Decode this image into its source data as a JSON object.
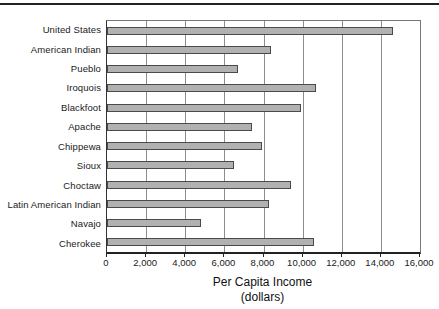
{
  "figure": {
    "top_rule_color": "#222222"
  },
  "chart_data": {
    "type": "bar",
    "orientation": "horizontal",
    "title": "",
    "xlabel": "Per Capita Income",
    "xlabel_sub": "(dollars)",
    "ylabel": "",
    "categories": [
      "United States",
      "American Indian",
      "Pueblo",
      "Iroquois",
      "Blackfoot",
      "Apache",
      "Chippewa",
      "Sioux",
      "Choctaw",
      "Latin American Indian",
      "Navajo",
      "Cherokee"
    ],
    "values": [
      14600,
      8400,
      6700,
      10700,
      9900,
      7400,
      7900,
      6500,
      9400,
      8300,
      4800,
      10600
    ],
    "xlim": [
      0,
      16000
    ],
    "xticks": [
      0,
      2000,
      4000,
      6000,
      8000,
      10000,
      12000,
      14000,
      16000
    ],
    "xtick_labels": [
      "0",
      "2,000",
      "4,000",
      "6,000",
      "8,000",
      "10,000",
      "12,000",
      "14,000",
      "16,000"
    ],
    "grid": true,
    "legend": "none",
    "bar_color": "#b1b1b1",
    "bar_border_color": "#4a4a4a",
    "gridline_color": "#8c8c8c",
    "axis_color": "#222222"
  }
}
